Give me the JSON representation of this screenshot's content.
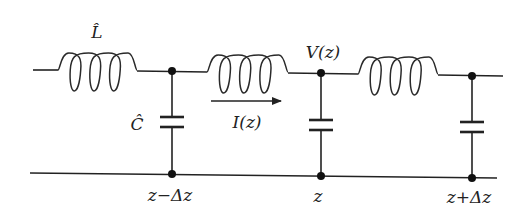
{
  "diagram": {
    "type": "transmission-line-lumped-element-model",
    "components": {
      "inductor_label": "L̂",
      "capacitor_label": "Ĉ"
    },
    "labels": {
      "voltage": "V(z)",
      "current": "I(z)",
      "positions": [
        "z−Δz",
        "z",
        "z+Δz"
      ]
    },
    "sections": [
      {
        "inductor": "series inductor 1",
        "shunt_capacitor_at": "z−Δz"
      },
      {
        "inductor": "series inductor 2",
        "shunt_capacitor_at": "z"
      },
      {
        "inductor": "series inductor 3",
        "shunt_capacitor_at": "z+Δz"
      }
    ],
    "current_direction": "right"
  }
}
